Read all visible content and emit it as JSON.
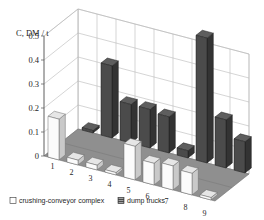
{
  "chart_data": {
    "type": "bar",
    "title": "",
    "subtitle": "",
    "xlabel": "",
    "ylabel": "C, DM / t",
    "ylim": [
      0,
      0.5
    ],
    "yticks": [
      "0",
      "0.1",
      "0.2",
      "0.3",
      "0.4",
      "0.5"
    ],
    "ytick_values": [
      0,
      0.1,
      0.2,
      0.3,
      0.4,
      0.5
    ],
    "grid": true,
    "projection": "3d",
    "legend_position": "bottom-left",
    "categories": [
      "1",
      "2",
      "3",
      "4",
      "5",
      "6",
      "7",
      "8",
      "9"
    ],
    "series": [
      {
        "name": "crushing-conveyor complex",
        "color": "#f2f2f2",
        "values": [
          0.17,
          0.02,
          0.02,
          0.01,
          0.14,
          0.09,
          0.1,
          0.09,
          0.01
        ]
      },
      {
        "name": "dump trucks",
        "color": "#454545",
        "values": [
          0.01,
          0.3,
          0.16,
          0.16,
          0.15,
          0.03,
          0.52,
          0.2,
          0.13
        ]
      }
    ]
  },
  "axis": {
    "y_title": "C, DM / t",
    "tick_0": "0",
    "tick_1": "0.1",
    "tick_2": "0.2",
    "tick_3": "0.3",
    "tick_4": "0.4",
    "tick_5": "0.5"
  },
  "legend": {
    "items": [
      {
        "label": "crushing-conveyor complex",
        "swatch": "hollow-square",
        "color": "#ffffff"
      },
      {
        "label": "dump trucks",
        "swatch": "hatched-square",
        "color": "#4a4a4a"
      }
    ]
  },
  "colors": {
    "floor": "#8f8f8f",
    "floor_edge": "#6e6e6e",
    "wall": "#ffffff",
    "grid": "#b9b9b9",
    "bar_light_front": "#fbfbfb",
    "bar_light_side": "#c9c9c9",
    "bar_light_top": "#e6e6e6",
    "bar_dark_front": "#4b4b4b",
    "bar_dark_side": "#333333",
    "bar_dark_top": "#5e5e5e"
  }
}
